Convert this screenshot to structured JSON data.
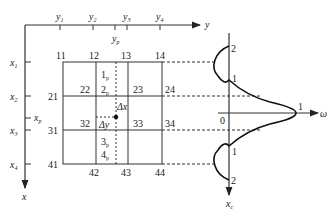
{
  "axes": {
    "y_axis_label": "y",
    "x_axis_label": "x",
    "omega_axis_label": "ω",
    "xc_axis_label": "x",
    "xc_axis_sub": "c",
    "origin_label": "0"
  },
  "y_ticks": [
    {
      "label": "y",
      "sub": "1"
    },
    {
      "label": "y",
      "sub": "2"
    },
    {
      "label": "y",
      "sub": "3"
    },
    {
      "label": "y",
      "sub": "4"
    }
  ],
  "y_point": {
    "label": "y",
    "sub": "p"
  },
  "x_ticks": [
    {
      "label": "x",
      "sub": "1"
    },
    {
      "label": "x",
      "sub": "2"
    },
    {
      "label": "x",
      "sub": "3"
    },
    {
      "label": "x",
      "sub": "4"
    }
  ],
  "x_point": {
    "label": "x",
    "sub": "p"
  },
  "grid_nodes": {
    "n11": "11",
    "n12": "12",
    "n13": "13",
    "n14": "14",
    "n21": "21",
    "n22": "22",
    "n23": "23",
    "n24": "24",
    "n31": "31",
    "n32": "32",
    "n33": "33",
    "n34": "34",
    "n41": "41",
    "n42": "42",
    "n43": "43",
    "n44": "44"
  },
  "interp_points": [
    {
      "label": "1",
      "sub": "p"
    },
    {
      "label": "2",
      "sub": "p"
    },
    {
      "label": "3",
      "sub": "p"
    },
    {
      "label": "4",
      "sub": "p"
    }
  ],
  "deltas": {
    "dx": "Δx",
    "dy": "Δy"
  },
  "curve_labels": {
    "top2": "2",
    "top1": "1",
    "peak1": "1",
    "bot1": "1",
    "bot2": "2"
  }
}
